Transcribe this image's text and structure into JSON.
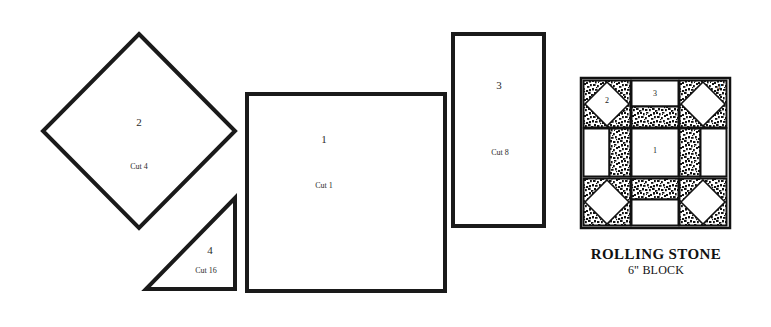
{
  "document": {
    "type": "quilt-block-pattern-sheet",
    "background_color": "#ffffff",
    "ink_color": "#1a1a1a"
  },
  "pattern_pieces": [
    {
      "id": "piece-2",
      "shape": "diamond",
      "number": "2",
      "cut": "Cut 4",
      "geometry": {
        "cx": 139,
        "cy": 131,
        "rx": 96,
        "ry": 97
      }
    },
    {
      "id": "piece-1",
      "shape": "square",
      "number": "1",
      "cut": "Cut 1",
      "geometry": {
        "x": 246,
        "y": 93,
        "w": 200,
        "h": 199
      }
    },
    {
      "id": "piece-3",
      "shape": "rectangle",
      "number": "3",
      "cut": "Cut 8",
      "geometry": {
        "x": 452,
        "y": 33,
        "w": 93,
        "h": 194
      }
    },
    {
      "id": "piece-4",
      "shape": "right-triangle",
      "number": "4",
      "cut": "Cut 16",
      "geometry": {
        "x1": 146,
        "y1": 290,
        "x2": 236,
        "y2": 290,
        "x3": 236,
        "y3": 197
      }
    }
  ],
  "block_diagram": {
    "title": "ROLLING STONE",
    "subtitle": "6\" BLOCK",
    "frame": {
      "x": 581,
      "y": 78,
      "w": 149,
      "h": 150
    },
    "grid": "3x3",
    "fabrics": {
      "light": "#ffffff",
      "print": "speckled-black-white",
      "outline": "#111111"
    },
    "labels": [
      {
        "text": "2",
        "x": 607,
        "y": 100,
        "on": "light-diamond"
      },
      {
        "text": "3",
        "x": 655,
        "y": 95,
        "on": "light-rectangle"
      },
      {
        "text": "4",
        "x": 718,
        "y": 88,
        "on": "print-corner"
      },
      {
        "text": "1",
        "x": 655,
        "y": 150,
        "on": "light-center-square"
      }
    ]
  }
}
